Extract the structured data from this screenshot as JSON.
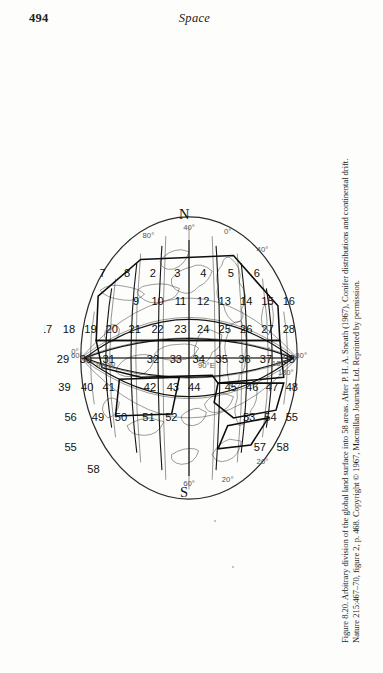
{
  "page": {
    "folio": "494",
    "running_head": "Space",
    "background_color": "#fdfdfb",
    "ink_color": "#1a1a1a"
  },
  "figure": {
    "number_label": "Figure 8.20.",
    "caption_line_1": "Figure 8.20.  Arbitrary division of the global land surface into 58 areas. After P. H. A. Sneath (1967), Conifer distributions and continental drift.",
    "caption_line_2": "Nature 215:467–70, figure 2, p. 468. Copyright © 1967, Macmillan Journals Ltd. Reprinted by permission.",
    "caption_full": "Figure 8.20. Arbitrary division of the global land surface into 58 areas. After P. H. A. Sneath (1967), Conifer distributions and continental drift. Nature 215:467–70, figure 2, p. 468. Copyright © 1967, Macmillan Journals Ltd. Reprinted by permission.",
    "orientation": "rotated-90-clockwise",
    "projection": "Mollweide-style elliptical world projection"
  },
  "map": {
    "pole_labels": [
      {
        "name": "north-pole-label",
        "text": "N"
      },
      {
        "name": "south-pole-label",
        "text": "S"
      }
    ],
    "meridian_labels": [
      {
        "text": "0°"
      },
      {
        "text": "90°E"
      },
      {
        "text": "180°"
      },
      {
        "text": "90°W"
      },
      {
        "text": "0°"
      },
      {
        "text": "180°"
      }
    ],
    "parallel_labels": [
      {
        "text": "80°"
      },
      {
        "text": "60°"
      },
      {
        "text": "40°"
      },
      {
        "text": "20°"
      },
      {
        "text": "0°"
      },
      {
        "text": "20°"
      },
      {
        "text": "40°"
      },
      {
        "text": "60°"
      },
      {
        "text": "80°"
      }
    ],
    "area_count": 58,
    "area_numbers": [
      "1",
      "2",
      "3",
      "4",
      "5",
      "6",
      "7",
      "8",
      "9",
      "10",
      "11",
      "12",
      "13",
      "14",
      "15",
      "16",
      "17",
      "18",
      "19",
      "20",
      "21",
      "22",
      "23",
      "24",
      "25",
      "26",
      "27",
      "28",
      "29",
      "30",
      "31",
      "32",
      "33",
      "34",
      "35",
      "36",
      "37",
      "38",
      "39",
      "40",
      "41",
      "42",
      "43",
      "44",
      "45",
      "46",
      "47",
      "48",
      "49",
      "50",
      "51",
      "52",
      "53",
      "54",
      "55",
      "56",
      "57",
      "58"
    ],
    "area_cells": [
      {
        "n": "16",
        "x": 92,
        "y": 44
      },
      {
        "n": "15",
        "x": 92,
        "y": 72
      },
      {
        "n": "6",
        "x": 64,
        "y": 86
      },
      {
        "n": "14",
        "x": 92,
        "y": 100
      },
      {
        "n": "5",
        "x": 64,
        "y": 120
      },
      {
        "n": "13",
        "x": 92,
        "y": 128
      },
      {
        "n": "4",
        "x": 64,
        "y": 156
      },
      {
        "n": "12",
        "x": 92,
        "y": 156
      },
      {
        "n": "3",
        "x": 64,
        "y": 190
      },
      {
        "n": "11",
        "x": 92,
        "y": 186
      },
      {
        "n": "2",
        "x": 64,
        "y": 222
      },
      {
        "n": "10",
        "x": 92,
        "y": 216
      },
      {
        "n": "9",
        "x": 92,
        "y": 244
      },
      {
        "n": "8",
        "x": 64,
        "y": 256
      },
      {
        "n": "7",
        "x": 64,
        "y": 288
      },
      {
        "n": "28",
        "x": 120,
        "y": 44
      },
      {
        "n": "27",
        "x": 120,
        "y": 72
      },
      {
        "n": "26",
        "x": 120,
        "y": 100
      },
      {
        "n": "25",
        "x": 120,
        "y": 128
      },
      {
        "n": "24",
        "x": 120,
        "y": 156
      },
      {
        "n": "23",
        "x": 120,
        "y": 186
      },
      {
        "n": "22",
        "x": 120,
        "y": 216
      },
      {
        "n": "21",
        "x": 120,
        "y": 246
      },
      {
        "n": "20",
        "x": 120,
        "y": 276
      },
      {
        "n": "19",
        "x": 120,
        "y": 304
      },
      {
        "n": "18",
        "x": 120,
        "y": 332
      },
      {
        "n": "17",
        "x": 120,
        "y": 362
      },
      {
        "n": "38",
        "x": 150,
        "y": 44
      },
      {
        "n": "37",
        "x": 150,
        "y": 74
      },
      {
        "n": "36",
        "x": 150,
        "y": 102
      },
      {
        "n": "35",
        "x": 150,
        "y": 132
      },
      {
        "n": "34",
        "x": 150,
        "y": 162
      },
      {
        "n": "33",
        "x": 150,
        "y": 192
      },
      {
        "n": "32",
        "x": 150,
        "y": 222
      },
      {
        "n": "31",
        "x": 150,
        "y": 280
      },
      {
        "n": "30",
        "x": 150,
        "y": 310
      },
      {
        "n": "29",
        "x": 150,
        "y": 340
      },
      {
        "n": "48",
        "x": 178,
        "y": 40
      },
      {
        "n": "47",
        "x": 178,
        "y": 66
      },
      {
        "n": "46",
        "x": 178,
        "y": 92
      },
      {
        "n": "45",
        "x": 178,
        "y": 120
      },
      {
        "n": "44",
        "x": 178,
        "y": 168
      },
      {
        "n": "43",
        "x": 178,
        "y": 196
      },
      {
        "n": "42",
        "x": 178,
        "y": 226
      },
      {
        "n": "41",
        "x": 178,
        "y": 280
      },
      {
        "n": "40",
        "x": 178,
        "y": 308
      },
      {
        "n": "39",
        "x": 178,
        "y": 338
      },
      {
        "n": "55",
        "x": 208,
        "y": 40
      },
      {
        "n": "54",
        "x": 208,
        "y": 68
      },
      {
        "n": "53",
        "x": 208,
        "y": 96
      },
      {
        "n": "52",
        "x": 208,
        "y": 198
      },
      {
        "n": "51",
        "x": 208,
        "y": 228
      },
      {
        "n": "50",
        "x": 208,
        "y": 264
      },
      {
        "n": "49",
        "x": 208,
        "y": 294
      },
      {
        "n": "56",
        "x": 208,
        "y": 330
      },
      {
        "n": "58",
        "x": 238,
        "y": 52
      },
      {
        "n": "57",
        "x": 238,
        "y": 82
      },
      {
        "n": "55b",
        "x": 238,
        "y": 330
      },
      {
        "n": "58b",
        "x": 260,
        "y": 300
      }
    ]
  }
}
